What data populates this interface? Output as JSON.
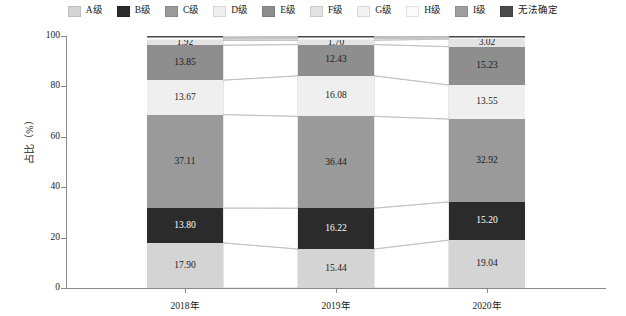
{
  "chart_data": {
    "type": "bar",
    "subtype": "stacked-percentage",
    "title": "",
    "xlabel": "",
    "ylabel": "占比（%）",
    "ylim": [
      0,
      100
    ],
    "yticks": [
      0,
      20,
      40,
      60,
      80,
      100
    ],
    "categories": [
      "2018年",
      "2019年",
      "2020年"
    ],
    "grid": false,
    "legend_position": "top",
    "series": [
      {
        "name": "A级",
        "color": "#d4d4d4",
        "label_color": "#1a1a1a",
        "values": [
          17.9,
          15.44,
          19.04
        ],
        "show_label": true
      },
      {
        "name": "B级",
        "color": "#2b2b2b",
        "label_color": "#ffffff",
        "values": [
          13.8,
          16.22,
          15.2
        ],
        "show_label": true
      },
      {
        "name": "C级",
        "color": "#9a9a9a",
        "label_color": "#1a1a1a",
        "values": [
          37.11,
          36.44,
          32.92
        ],
        "show_label": true
      },
      {
        "name": "D级",
        "color": "#efefef",
        "label_color": "#1a1a1a",
        "values": [
          13.67,
          16.08,
          13.55
        ],
        "show_label": true
      },
      {
        "name": "E级",
        "color": "#8e8e8e",
        "label_color": "#1a1a1a",
        "values": [
          13.85,
          12.43,
          15.23
        ],
        "show_label": true
      },
      {
        "name": "F级",
        "color": "#e3e3e3",
        "label_color": "#1a1a1a",
        "values": [
          1.92,
          1.7,
          3.02
        ],
        "show_label": true
      },
      {
        "name": "G级",
        "color": "#f2f2f2",
        "label_color": "#1a1a1a",
        "values": [
          0.55,
          0.62,
          0.48
        ],
        "show_label": false
      },
      {
        "name": "H级",
        "color": "#fbfbfb",
        "label_color": "#1a1a1a",
        "values": [
          0.4,
          0.45,
          0.3
        ],
        "show_label": false
      },
      {
        "name": "I级",
        "color": "#9e9e9e",
        "label_color": "#1a1a1a",
        "values": [
          0.35,
          0.38,
          0.18
        ],
        "show_label": false
      },
      {
        "name": "无法确定",
        "color": "#4a4a4a",
        "label_color": "#ffffff",
        "values": [
          0.45,
          0.24,
          0.28
        ],
        "show_label": false
      }
    ],
    "value_labels": {
      "2018年": [
        "17.90",
        "13.80",
        "37.11",
        "13.67",
        "13.85",
        "1.92"
      ],
      "2019年": [
        "15.44",
        "16.22",
        "36.44",
        "16.08",
        "12.43",
        "1.70"
      ],
      "2020年": [
        "19.04",
        "15.20",
        "32.92",
        "13.55",
        "15.23",
        "3.02"
      ]
    }
  },
  "legend": {
    "items": [
      {
        "label": "A级"
      },
      {
        "label": "B级"
      },
      {
        "label": "C级"
      },
      {
        "label": "D级"
      },
      {
        "label": "E级"
      },
      {
        "label": "F级"
      },
      {
        "label": "G级"
      },
      {
        "label": "H级"
      },
      {
        "label": "I级"
      },
      {
        "label": "无法确定"
      }
    ]
  },
  "axes": {
    "y_label": "占比（%）",
    "y_ticks": [
      "0",
      "20",
      "40",
      "60",
      "80",
      "100"
    ],
    "x_ticks": [
      "2018年",
      "2019年",
      "2020年"
    ]
  }
}
